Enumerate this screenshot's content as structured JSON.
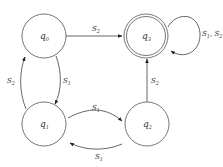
{
  "diagram": {
    "type": "finite-automaton",
    "nodes": [
      {
        "id": "q0",
        "label": "q",
        "sub": "0",
        "accepting": false
      },
      {
        "id": "q1",
        "label": "q",
        "sub": "1",
        "accepting": false
      },
      {
        "id": "q2",
        "label": "q",
        "sub": "2",
        "accepting": false
      },
      {
        "id": "q3",
        "label": "q",
        "sub": "3",
        "accepting": true
      }
    ],
    "edges": [
      {
        "from": "q0",
        "to": "q3",
        "label": "S",
        "sub": "2"
      },
      {
        "from": "q0",
        "to": "q1",
        "label": "S",
        "sub": "1"
      },
      {
        "from": "q1",
        "to": "q0",
        "label": "S",
        "sub": "2"
      },
      {
        "from": "q1",
        "to": "q2",
        "label": "S",
        "sub": "1"
      },
      {
        "from": "q2",
        "to": "q1",
        "label": "S",
        "sub": "1"
      },
      {
        "from": "q2",
        "to": "q3",
        "label": "S",
        "sub": "2"
      },
      {
        "from": "q3",
        "to": "q3",
        "label": "S",
        "sub": "1",
        "label2": "S",
        "sub2": "2",
        "sep": ", "
      }
    ],
    "colors": {
      "stroke": "#666666",
      "text": "#333333",
      "background": "#ffffff"
    }
  }
}
